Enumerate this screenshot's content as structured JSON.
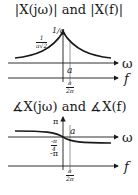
{
  "magnitude_panel": {
    "title": "|X(jω)| and |X(f)|",
    "peak_label": "1/a",
    "half_power_num": "1",
    "half_power_den": "a√2",
    "omega_axis_label": "ω",
    "f_axis_label": "f",
    "omega_tick": "a",
    "f_tick_num": "a",
    "f_tick_den": "2π"
  },
  "phase_panel": {
    "title": "∡X(jω) and ∡X(f)",
    "pi_label": "π",
    "neg_pi_label": "-π",
    "quarter_num": "-π",
    "quarter_den": "4",
    "omega_axis_label": "ω",
    "f_axis_label": "f",
    "omega_tick": "a",
    "f_tick_num": "a",
    "f_tick_den": "2π"
  },
  "colors": {
    "line": "#1a1a1a",
    "background": "#ffffff"
  }
}
